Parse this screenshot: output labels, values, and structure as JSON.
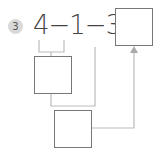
{
  "problem": {
    "number": "3",
    "expression": "4−1−3=",
    "answer_box": "",
    "step_box_1": "",
    "step_box_2": ""
  },
  "colors": {
    "line": "#bbbbbb",
    "box_border": "#777777",
    "badge_bg": "#d9d9d9"
  }
}
